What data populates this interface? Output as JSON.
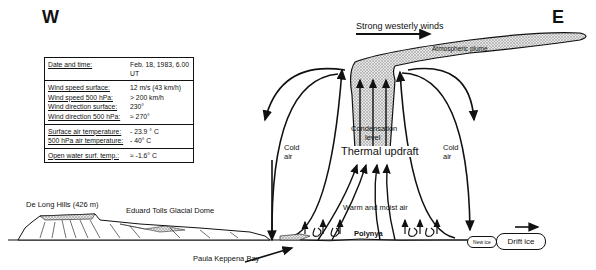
{
  "directions": {
    "west": "W",
    "east": "E"
  },
  "info_table": {
    "groups": [
      {
        "rows": [
          {
            "label": "Date and time:",
            "value": "Feb. 18, 1983, 6.00 UT"
          }
        ]
      },
      {
        "rows": [
          {
            "label": "Wind speed surface:",
            "value": "12 m/s (43 km/h)"
          },
          {
            "label": "Wind speed 500 hPa:",
            "value": "> 200 km/h"
          },
          {
            "label": "Wind direction surface:",
            "value": "230°"
          },
          {
            "label": "Wind direction 500 hPa:",
            "value": "≈ 270°"
          }
        ]
      },
      {
        "rows": [
          {
            "label": "Surface air temperature:",
            "value": "- 23.9 ° C"
          },
          {
            "label": "500 hPa air temperature:",
            "value": "- 40° C"
          }
        ]
      },
      {
        "rows": [
          {
            "label": "Open water surf. temp.:",
            "value": "≈ -1.6° C"
          }
        ]
      }
    ]
  },
  "labels": {
    "strong_winds": "Strong westerly winds",
    "plume": "Atmospheric plume",
    "condensation_1": "Condensation",
    "condensation_2": "level",
    "thermal_updraft": "Thermal updraft",
    "cold_air_left_1": "Cold",
    "cold_air_left_2": "air",
    "cold_air_right_1": "Cold",
    "cold_air_right_2": "air",
    "warm_moist_air": "Warm and moist air",
    "polynya": "Polynya",
    "new_ice": "New ice",
    "drift_ice": "Drift ice",
    "de_long_hills": "De Long Hills (426 m)",
    "glacial_dome": "Eduard Tolls Glacial Dome",
    "paula_keppena_bay": "Paula Keppena Bay"
  },
  "colors": {
    "line": "#111111",
    "stipple": "#c8c8c8",
    "background": "#ffffff"
  }
}
